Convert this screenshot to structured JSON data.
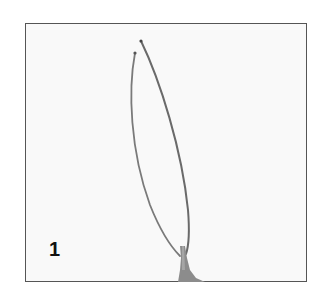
{
  "figure": {
    "panel_label": "1",
    "colors": {
      "frame": "#555555",
      "wire": "#6e6e6e",
      "base": "#8a8a8a",
      "background": "#f9f9f9"
    }
  }
}
